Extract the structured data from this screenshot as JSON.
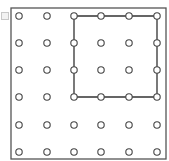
{
  "diagram": {
    "type": "geoboard",
    "grid": {
      "rows": 6,
      "cols": 6
    },
    "frame": {
      "x": 11,
      "y": 8,
      "width": 155,
      "height": 151,
      "stroke": "#555555"
    },
    "peg": {
      "radius": 3.2,
      "stroke": "#444444",
      "fill": "#ffffff"
    },
    "col_positions": [
      19,
      47,
      74,
      101,
      129,
      157
    ],
    "row_positions": [
      16,
      43,
      70,
      97,
      125,
      152
    ],
    "band": {
      "shape": "square",
      "stroke": "#333333",
      "vertices": [
        [
          3,
          1
        ],
        [
          6,
          1
        ],
        [
          6,
          4
        ],
        [
          3,
          4
        ]
      ]
    }
  }
}
